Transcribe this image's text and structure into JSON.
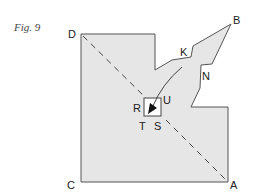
{
  "figure": {
    "caption": "Fig. 9",
    "fill_color": "#e6e6e6",
    "stroke_color": "#555555",
    "labels": {
      "A": "A",
      "B": "B",
      "C": "C",
      "D": "D",
      "K": "K",
      "N": "N",
      "R": "R",
      "S": "S",
      "T": "T",
      "U": "U"
    }
  }
}
